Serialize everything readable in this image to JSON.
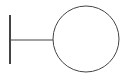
{
  "diagram": {
    "symbol": "uml-boundary",
    "stroke_color": "#444444",
    "background": "#ffffff",
    "bar": {
      "x": 10,
      "y1": 15,
      "y2": 64,
      "width": 2
    },
    "connector": {
      "x1": 10,
      "x2": 53,
      "y": 40,
      "width": 1
    },
    "circle": {
      "cx": 86,
      "cy": 39,
      "r": 33,
      "width": 1
    }
  }
}
